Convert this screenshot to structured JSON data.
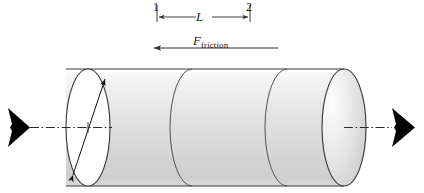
{
  "figure": {
    "type": "engineering-diagram",
    "station_1_label": "1",
    "station_2_label": "2",
    "length_label": "L",
    "friction_symbol": "F",
    "friction_subscript": "friction",
    "colors": {
      "outline": "#3a3a3a",
      "cylinder_light": "#f2f2f2",
      "cylinder_mid": "#dcdcdc",
      "cylinder_shadow": "#c9c9c9",
      "end_cap_highlight": "#fbfbfb",
      "arrow_fill": "#000000",
      "centerline": "#2a2a2a",
      "background": "#ffffff"
    },
    "geometry": {
      "cylinder_left_x": 66,
      "cylinder_right_x": 366,
      "cylinder_top_y": 69,
      "cylinder_bottom_y": 186,
      "axis_y": 127,
      "ellipse_rx": 22,
      "ellipse_ry": 58,
      "internal_arc_x": [
        192,
        287
      ],
      "station_1_x": 157,
      "station_2_x": 250,
      "dimension_line_y": 17,
      "friction_arrow_y": 48,
      "friction_arrow_left_x": 152,
      "friction_arrow_right_x": 278
    },
    "elements": {
      "left_force_arrow": "thick-black-right-arrow",
      "right_force_arrow": "thick-black-right-arrow",
      "diameter_arrow": "double-headed-diagonal-arrow",
      "centerline_style": "dash-dot",
      "friction_arrow_direction": "left",
      "internal_arc_count": 2
    }
  }
}
